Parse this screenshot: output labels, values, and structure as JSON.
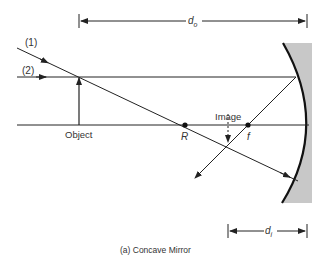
{
  "diagram": {
    "type": "ray-diagram",
    "caption": "(a) Concave Mirror",
    "labels": {
      "ray1": "(1)",
      "ray2": "(2)",
      "object": "Object",
      "image": "Image",
      "center_of_curvature": "R",
      "focal_point": "f",
      "object_distance_main": "d",
      "object_distance_sub": "o",
      "image_distance_main": "d",
      "image_distance_sub": "i"
    },
    "colors": {
      "line": "#222222",
      "mirror_fill": "#c8c8c8",
      "text": "#333333"
    }
  }
}
